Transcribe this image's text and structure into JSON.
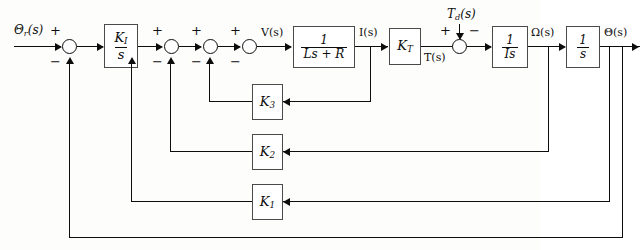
{
  "diagram": {
    "type": "control-system-block-diagram",
    "stroke_color": "#0d0d0d",
    "block_border_color": "#4a4a4a",
    "background": "#fdfdfc"
  },
  "signals": {
    "reference": "Θ",
    "reference_sub": "r",
    "reference_suffix": "(s)",
    "voltage": "V(s)",
    "current": "I(s)",
    "torque": "T(s)",
    "disturbance": "T",
    "disturbance_sub": "d",
    "disturbance_suffix": "(s)",
    "speed": "Ω(s)",
    "output": "Θ(s)"
  },
  "blocks": [
    {
      "name": "integral-controller",
      "num": "K",
      "num_sub": "I",
      "den": "s",
      "kind": "fraction"
    },
    {
      "name": "electrical-plant",
      "num": "1",
      "den": "Ls + R",
      "kind": "fraction"
    },
    {
      "name": "torque-constant",
      "label": "K",
      "label_sub": "T",
      "kind": "gain"
    },
    {
      "name": "inertia",
      "num": "1",
      "den": "Is",
      "kind": "fraction"
    },
    {
      "name": "integrator",
      "num": "1",
      "den": "s",
      "kind": "fraction"
    },
    {
      "name": "current-feedback-gain",
      "label": "K",
      "label_sub": "3",
      "kind": "gain"
    },
    {
      "name": "velocity-feedback-gain",
      "label": "K",
      "label_sub": "2",
      "kind": "gain"
    },
    {
      "name": "position-feedback-gain",
      "label": "K",
      "label_sub": "1",
      "kind": "gain"
    }
  ],
  "summing_junctions": [
    {
      "name": "summer-outer-loop",
      "plus": "+",
      "minus": "−"
    },
    {
      "name": "summer-k1-loop",
      "plus": "+",
      "minus": "−"
    },
    {
      "name": "summer-k2-loop",
      "plus": "+",
      "minus": "−"
    },
    {
      "name": "summer-k3-loop",
      "plus": "+",
      "minus": "−"
    },
    {
      "name": "summer-disturbance",
      "plus": "+",
      "minus": "−"
    }
  ]
}
